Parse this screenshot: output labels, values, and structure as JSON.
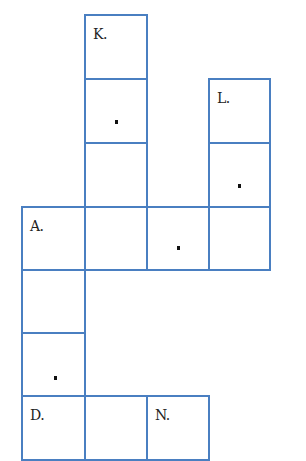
{
  "puzzle": {
    "border_color": "#4a7fc1",
    "cells": [
      {
        "id": "k1",
        "col": 1,
        "row": 0,
        "label": "K.",
        "dot": false
      },
      {
        "id": "k2",
        "col": 1,
        "row": 1,
        "label": "",
        "dot": true
      },
      {
        "id": "k3",
        "col": 1,
        "row": 2,
        "label": "",
        "dot": false
      },
      {
        "id": "l1",
        "col": 3,
        "row": 1,
        "label": "L.",
        "dot": false
      },
      {
        "id": "l2",
        "col": 3,
        "row": 2,
        "label": "",
        "dot": true
      },
      {
        "id": "a1",
        "col": 0,
        "row": 3,
        "label": "A.",
        "dot": false
      },
      {
        "id": "a2",
        "col": 1,
        "row": 3,
        "label": "",
        "dot": false
      },
      {
        "id": "a3",
        "col": 2,
        "row": 3,
        "label": "",
        "dot": true
      },
      {
        "id": "a4",
        "col": 3,
        "row": 3,
        "label": "",
        "dot": false
      },
      {
        "id": "d1",
        "col": 0,
        "row": 4,
        "label": "",
        "dot": false
      },
      {
        "id": "d2",
        "col": 0,
        "row": 5,
        "label": "",
        "dot": true
      },
      {
        "id": "dn1",
        "col": 0,
        "row": 6,
        "label": "D.",
        "dot": false
      },
      {
        "id": "dn2",
        "col": 1,
        "row": 6,
        "label": "",
        "dot": false
      },
      {
        "id": "dn3",
        "col": 2,
        "row": 6,
        "label": "N.",
        "dot": false
      }
    ],
    "labels": {
      "k": "K.",
      "l": "L.",
      "a": "A.",
      "d": "D.",
      "n": "N."
    }
  }
}
